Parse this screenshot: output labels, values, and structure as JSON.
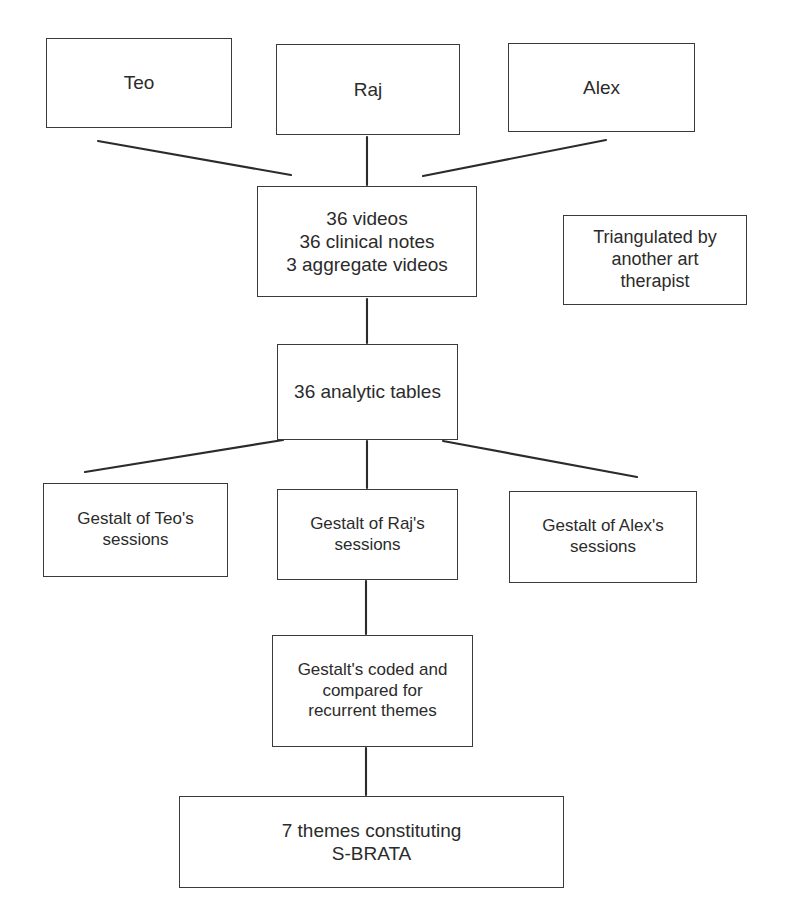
{
  "diagram": {
    "type": "flowchart",
    "canvas": {
      "width": 787,
      "height": 924
    },
    "style": {
      "background_color": "#ffffff",
      "box_border_color": "#3a3a3a",
      "text_color": "#2b2b2b",
      "connector_color": "#2b2b2b"
    },
    "nodes": [
      {
        "id": "teo",
        "label": "Teo"
      },
      {
        "id": "raj",
        "label": "Raj"
      },
      {
        "id": "alex",
        "label": "Alex"
      },
      {
        "id": "materials",
        "label": "36 videos\n36 clinical notes\n3 aggregate videos"
      },
      {
        "id": "triangulated",
        "label": "Triangulated by\nanother art\ntherapist"
      },
      {
        "id": "tables",
        "label": "36 analytic tables"
      },
      {
        "id": "gestalt_teo",
        "label": "Gestalt of Teo's\nsessions"
      },
      {
        "id": "gestalt_raj",
        "label": "Gestalt of Raj's\nsessions"
      },
      {
        "id": "gestalt_alex",
        "label": "Gestalt of Alex's\nsessions"
      },
      {
        "id": "coded",
        "label": "Gestalt's coded and\ncompared for\nrecurrent themes"
      },
      {
        "id": "themes",
        "label": "7 themes constituting\nS-BRATA"
      }
    ],
    "edges": [
      {
        "id": "teo-to-materials",
        "from": "teo",
        "to": "materials",
        "kind": "diagonal"
      },
      {
        "id": "raj-to-materials",
        "from": "raj",
        "to": "materials",
        "kind": "vertical"
      },
      {
        "id": "alex-to-materials",
        "from": "alex",
        "to": "materials",
        "kind": "diagonal"
      },
      {
        "id": "materials-to-tables",
        "from": "materials",
        "to": "tables",
        "kind": "vertical"
      },
      {
        "id": "tables-to-gestalt-teo",
        "from": "tables",
        "to": "gestalt_teo",
        "kind": "diagonal"
      },
      {
        "id": "tables-to-gestalt-raj",
        "from": "tables",
        "to": "gestalt_raj",
        "kind": "vertical"
      },
      {
        "id": "tables-to-gestalt-alex",
        "from": "tables",
        "to": "gestalt_alex",
        "kind": "diagonal"
      },
      {
        "id": "gestalt-raj-to-coded",
        "from": "gestalt_raj",
        "to": "coded",
        "kind": "vertical"
      },
      {
        "id": "coded-to-themes",
        "from": "coded",
        "to": "themes",
        "kind": "vertical"
      }
    ]
  }
}
